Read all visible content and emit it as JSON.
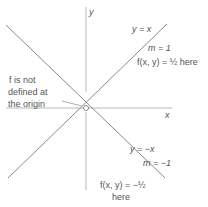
{
  "axes": {
    "x_label": "x",
    "y_label": "y"
  },
  "lines": [
    {
      "equation": "y = x",
      "slope": "m = 1",
      "value_note": "f(x, y) = ½ here"
    },
    {
      "equation": "y = −x",
      "slope": "m = −1",
      "value_note_line1": "f(x, y) = −½",
      "value_note_line2": "here"
    }
  ],
  "origin_note": {
    "line1": "f is not",
    "line2": "defined at",
    "line3": "the origin"
  },
  "colors": {
    "line": "#8a8a8a",
    "axis": "#b0b0b0",
    "text": "#555555"
  }
}
